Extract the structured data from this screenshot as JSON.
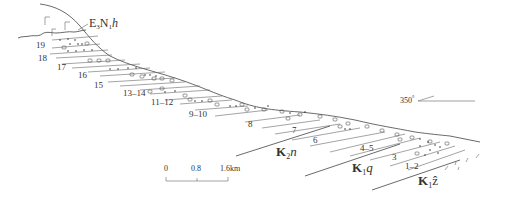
{
  "diagram": {
    "type": "geological-cross-section",
    "formations": {
      "top": {
        "main": "E",
        "sub1": "3",
        "mid": "N",
        "sub2": "1",
        "suffix": "h"
      },
      "k2n": {
        "main": "K",
        "sub": "2",
        "suffix": "n"
      },
      "k1q": {
        "main": "K",
        "sub": "1",
        "suffix": "q"
      },
      "k1z": {
        "main": "K",
        "sub": "1",
        "suffix": "ẑ"
      }
    },
    "layers": [
      "19",
      "18",
      "17",
      "16",
      "15",
      "13–14",
      "11–12",
      "9–10",
      "8",
      "7",
      "6",
      "4–5",
      "3",
      "1–2"
    ],
    "orientation": {
      "label": "350",
      "unit": "°"
    },
    "scale_bar": {
      "ticks": [
        "0",
        "0.8",
        "1.6km"
      ]
    }
  }
}
